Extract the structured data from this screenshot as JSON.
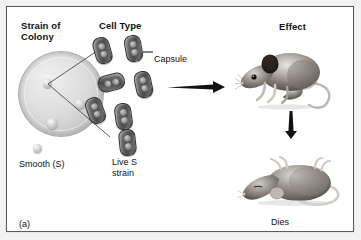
{
  "figure": {
    "panel_label": "(a)",
    "headers": {
      "strain_of_colony": "Strain of\nColony",
      "strain_line1": "Strain of",
      "strain_line2": "Colony",
      "cell_type": "Cell Type",
      "effect": "Effect"
    },
    "labels": {
      "capsule": "Capsule",
      "smooth": "Smooth (S)",
      "live_strain_line1": "Live S",
      "live_strain_line2": "strain",
      "dies": "Dies"
    },
    "icons": {
      "petri_dish": "petri-dish-icon",
      "colony": "bacterial-colony-icon",
      "cell": "capsulated-bacterium-icon",
      "arrow_right": "arrow-right-icon",
      "arrow_down": "arrow-down-icon",
      "mouse_live": "live-mouse-icon",
      "mouse_dead": "dead-mouse-icon"
    },
    "colors": {
      "frame_border": "#5a5a60",
      "page_background": "#f2f2f2",
      "panel_background": "#ffffff",
      "text": "#111111",
      "cell_fill": "#4a4a4a",
      "dish_fill": "#dcdcdc",
      "arrow": "#111111"
    }
  }
}
